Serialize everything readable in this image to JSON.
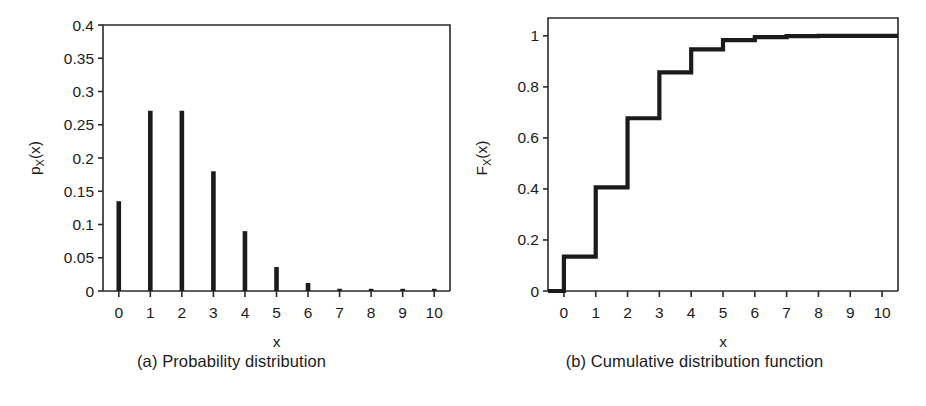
{
  "figure": {
    "panels": [
      {
        "id": "a",
        "caption": "(a) Probability distribution",
        "xlabel": "x",
        "ylabel_main": "p",
        "ylabel_sub": "X",
        "ylabel_arg": "(x)"
      },
      {
        "id": "b",
        "caption": "(b) Cumulative distribution function",
        "xlabel": "x",
        "ylabel_main": "F",
        "ylabel_sub": "X",
        "ylabel_arg": "(x)"
      }
    ]
  },
  "chart_data": [
    {
      "type": "bar",
      "title": "(a) Probability distribution",
      "xlabel": "x",
      "ylabel": "p_X(x)",
      "categories": [
        0,
        1,
        2,
        3,
        4,
        5,
        6,
        7,
        8,
        9,
        10
      ],
      "values": [
        0.135,
        0.271,
        0.271,
        0.18,
        0.09,
        0.036,
        0.012,
        0.0034,
        0.0009,
        0.0002,
        4e-05
      ],
      "xtick_labels": [
        "0",
        "1",
        "2",
        "3",
        "4",
        "5",
        "6",
        "7",
        "8",
        "9",
        "10"
      ],
      "ytick_labels": [
        "0",
        "0.05",
        "0.1",
        "0.15",
        "0.2",
        "0.25",
        "0.3",
        "0.35",
        "0.4"
      ],
      "ytick_values": [
        0,
        0.05,
        0.1,
        0.15,
        0.2,
        0.25,
        0.3,
        0.35,
        0.4
      ],
      "xlim": [
        -0.5,
        10.5
      ],
      "ylim": [
        0,
        0.4
      ],
      "grid": false,
      "legend": "none",
      "line_color": "#1b1b1b"
    },
    {
      "type": "line",
      "title": "(b) Cumulative distribution function",
      "xlabel": "x",
      "ylabel": "F_X(x)",
      "x": [
        0,
        1,
        2,
        3,
        4,
        5,
        6,
        7,
        8,
        9,
        10
      ],
      "values": [
        0.135,
        0.406,
        0.677,
        0.857,
        0.947,
        0.983,
        0.995,
        0.999,
        1.0,
        1.0,
        1.0
      ],
      "xtick_labels": [
        "0",
        "1",
        "2",
        "3",
        "4",
        "5",
        "6",
        "7",
        "8",
        "9",
        "10"
      ],
      "ytick_labels": [
        "0",
        "0.2",
        "0.4",
        "0.6",
        "0.8",
        "1"
      ],
      "ytick_values": [
        0,
        0.2,
        0.4,
        0.6,
        0.8,
        1.0
      ],
      "xlim": [
        -0.5,
        10.5
      ],
      "ylim": [
        0,
        1.07
      ],
      "grid": false,
      "legend": "none",
      "line_color": "#1b1b1b",
      "step_style": "post"
    }
  ]
}
